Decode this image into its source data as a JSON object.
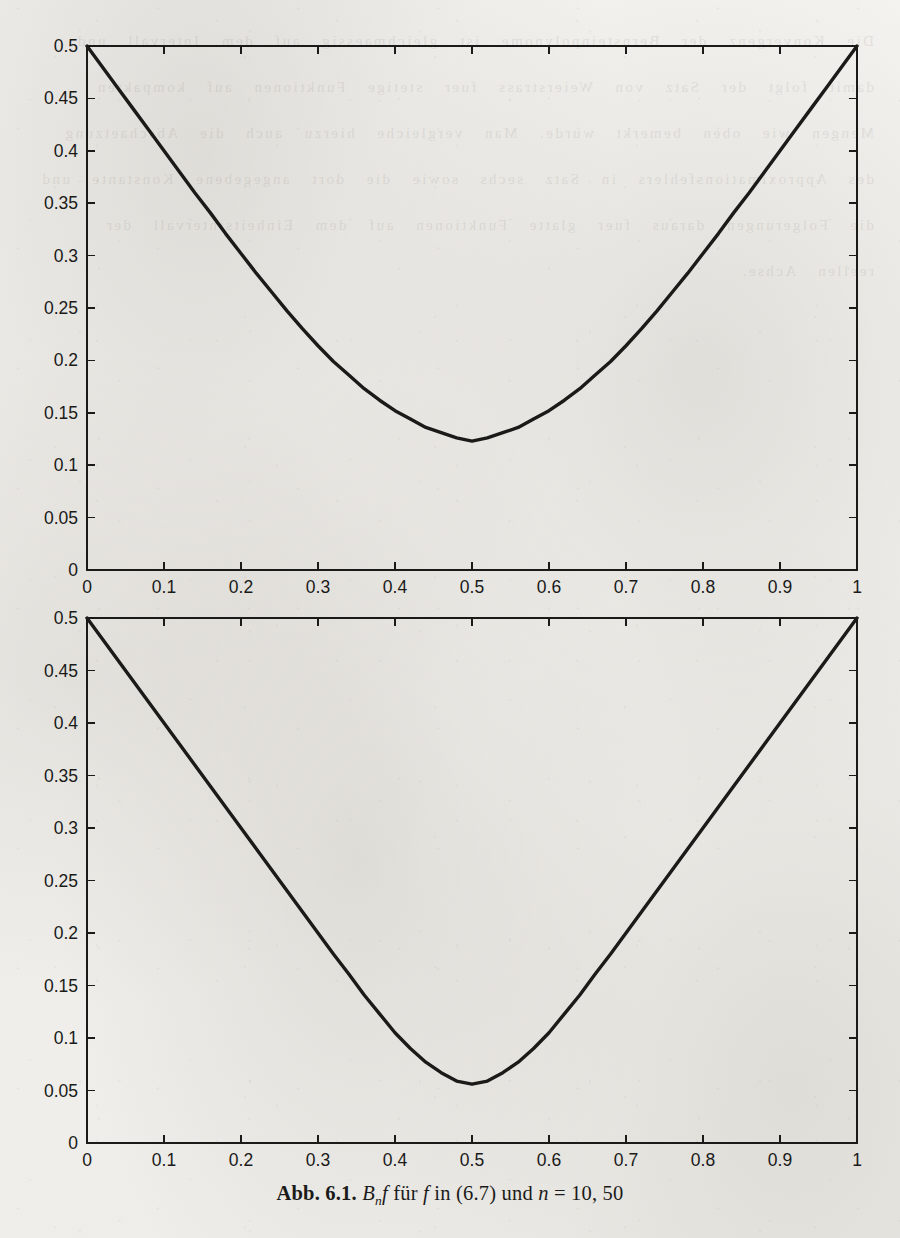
{
  "figure": {
    "caption": {
      "label": "Abb. 6.1.",
      "body_1": "B",
      "body_sub": "n",
      "body_2": "f",
      "body_3": "für",
      "body_4": "f",
      "body_5": "in (6.7) und",
      "body_6": "n",
      "body_7": "= 10, 50",
      "full_text": "Abb. 6.1. B_n f für f in (6.7) und n = 10, 50"
    },
    "ink_color": "#1a1a19",
    "paper_color": "#f1f0ec"
  },
  "chart_data": [
    {
      "type": "line",
      "title": "",
      "subtitle": "Bernstein polynomial approximation, n = 10",
      "xlabel": "",
      "ylabel": "",
      "xlim": [
        0,
        1
      ],
      "ylim": [
        0,
        0.5
      ],
      "grid": false,
      "legend": "none",
      "n": 10,
      "xticks": [
        0,
        0.1,
        0.2,
        0.3,
        0.4,
        0.5,
        0.6,
        0.7,
        0.8,
        0.9,
        1
      ],
      "xticklabels": [
        "0",
        "0.1",
        "0.2",
        "0.3",
        "0.4",
        "0.5",
        "0.6",
        "0.7",
        "0.8",
        "0.9",
        "1"
      ],
      "yticks": [
        0,
        0.05,
        0.1,
        0.15,
        0.2,
        0.25,
        0.3,
        0.35,
        0.4,
        0.45,
        0.5
      ],
      "yticklabels": [
        "0",
        "0.05",
        "0.1",
        "0.15",
        "0.2",
        "0.25",
        "0.3",
        "0.35",
        "0.4",
        "0.45",
        "0.5"
      ],
      "minimum": {
        "x": 0.5,
        "y": 0.123
      },
      "endpoints": [
        {
          "x": 0,
          "y": 0.5
        },
        {
          "x": 1,
          "y": 0.5
        }
      ],
      "x": [
        0,
        0.02,
        0.04,
        0.06,
        0.08,
        0.1,
        0.12,
        0.14,
        0.16,
        0.18,
        0.2,
        0.22,
        0.24,
        0.26,
        0.28,
        0.3,
        0.32,
        0.34,
        0.36,
        0.38,
        0.4,
        0.42,
        0.44,
        0.46,
        0.48,
        0.5,
        0.52,
        0.54,
        0.56,
        0.58,
        0.6,
        0.62,
        0.64,
        0.66,
        0.68,
        0.7,
        0.72,
        0.74,
        0.76,
        0.78,
        0.8,
        0.82,
        0.84,
        0.86,
        0.88,
        0.9,
        0.92,
        0.94,
        0.96,
        0.98,
        1.0
      ],
      "values": [
        0.5,
        0.48,
        0.46,
        0.44,
        0.42,
        0.4,
        0.38,
        0.36,
        0.341,
        0.321,
        0.302,
        0.283,
        0.265,
        0.247,
        0.23,
        0.214,
        0.199,
        0.186,
        0.173,
        0.162,
        0.152,
        0.144,
        0.136,
        0.131,
        0.126,
        0.123,
        0.126,
        0.131,
        0.136,
        0.144,
        0.152,
        0.162,
        0.173,
        0.186,
        0.199,
        0.214,
        0.23,
        0.247,
        0.265,
        0.283,
        0.302,
        0.321,
        0.341,
        0.36,
        0.38,
        0.4,
        0.42,
        0.44,
        0.46,
        0.48,
        0.5
      ]
    },
    {
      "type": "line",
      "title": "",
      "subtitle": "Bernstein polynomial approximation, n = 50",
      "xlabel": "",
      "ylabel": "",
      "xlim": [
        0,
        1
      ],
      "ylim": [
        0,
        0.5
      ],
      "grid": false,
      "legend": "none",
      "n": 50,
      "xticks": [
        0,
        0.1,
        0.2,
        0.3,
        0.4,
        0.5,
        0.6,
        0.7,
        0.8,
        0.9,
        1
      ],
      "xticklabels": [
        "0",
        "0.1",
        "0.2",
        "0.3",
        "0.4",
        "0.5",
        "0.6",
        "0.7",
        "0.8",
        "0.9",
        "1"
      ],
      "yticks": [
        0,
        0.05,
        0.1,
        0.15,
        0.2,
        0.25,
        0.3,
        0.35,
        0.4,
        0.45,
        0.5
      ],
      "yticklabels": [
        "0",
        "0.05",
        "0.1",
        "0.15",
        "0.2",
        "0.25",
        "0.3",
        "0.35",
        "0.4",
        "0.45",
        "0.5"
      ],
      "minimum": {
        "x": 0.5,
        "y": 0.056
      },
      "endpoints": [
        {
          "x": 0,
          "y": 0.5
        },
        {
          "x": 1,
          "y": 0.5
        }
      ],
      "x": [
        0,
        0.02,
        0.04,
        0.06,
        0.08,
        0.1,
        0.12,
        0.14,
        0.16,
        0.18,
        0.2,
        0.22,
        0.24,
        0.26,
        0.28,
        0.3,
        0.32,
        0.34,
        0.36,
        0.38,
        0.4,
        0.42,
        0.44,
        0.46,
        0.48,
        0.5,
        0.52,
        0.54,
        0.56,
        0.58,
        0.6,
        0.62,
        0.64,
        0.66,
        0.68,
        0.7,
        0.72,
        0.74,
        0.76,
        0.78,
        0.8,
        0.82,
        0.84,
        0.86,
        0.88,
        0.9,
        0.92,
        0.94,
        0.96,
        0.98,
        1.0
      ],
      "values": [
        0.5,
        0.48,
        0.46,
        0.44,
        0.42,
        0.4,
        0.38,
        0.36,
        0.34,
        0.32,
        0.3,
        0.28,
        0.26,
        0.24,
        0.22,
        0.2,
        0.18,
        0.161,
        0.141,
        0.123,
        0.105,
        0.09,
        0.077,
        0.067,
        0.059,
        0.056,
        0.059,
        0.067,
        0.077,
        0.09,
        0.105,
        0.123,
        0.141,
        0.161,
        0.18,
        0.2,
        0.22,
        0.24,
        0.26,
        0.28,
        0.3,
        0.32,
        0.34,
        0.36,
        0.38,
        0.4,
        0.42,
        0.44,
        0.46,
        0.48,
        0.5
      ]
    }
  ],
  "bleed_text": "Die Konvergenz der Bernsteinpolynome ist gleichmaessig auf dem Intervall und damit folgt der Satz von Weierstrass fuer stetige Funktionen auf kompakten Mengen wie oben bemerkt wurde. Man vergleiche hierzu auch die Abschaetzung des Approximationsfehlers in Satz sechs sowie die dort angegebene Konstante und die Folgerungen daraus fuer glatte Funktionen auf dem Einheitsintervall der reellen Achse."
}
